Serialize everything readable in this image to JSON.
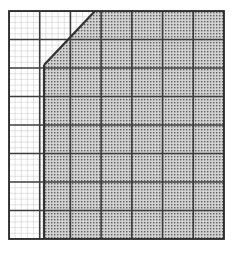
{
  "figure": {
    "title": "",
    "caption": "",
    "type": "shaded-region-grid"
  },
  "grid": {
    "x0": 9,
    "y0": 11,
    "x1": 224,
    "y1": 239,
    "major_cell_width": 30.71,
    "major_cell_height": 28.5,
    "major_cols": 7,
    "major_rows": 8,
    "minor_per_major_x": 5,
    "minor_per_major_y": 5,
    "major_line_color": "#3c3c3c",
    "minor_line_color": "#b9b9b9",
    "border_color": "#2b2b2b",
    "major_line_width": 1.6,
    "minor_line_width": 0.4,
    "border_width": 1.8,
    "background_color": "#ffffff"
  },
  "region": {
    "label": "",
    "fill_color": "#cfcfcf",
    "fill_pattern": "stipple-dots",
    "dot_color": "#6e6e6e",
    "boundary_color": "#333333",
    "boundary_width": 2.2,
    "vertical_boundary_x": 44,
    "vertex_x": 44,
    "vertex_y": 65,
    "diagonal_top_x": 95,
    "diagonal_top_y": 11,
    "vertices": [
      [
        44,
        239
      ],
      [
        44,
        65
      ],
      [
        95,
        11
      ],
      [
        224,
        11
      ],
      [
        224,
        239
      ]
    ]
  },
  "axes": {
    "x_ticks": [],
    "y_ticks": [],
    "x_label": "",
    "y_label": ""
  }
}
